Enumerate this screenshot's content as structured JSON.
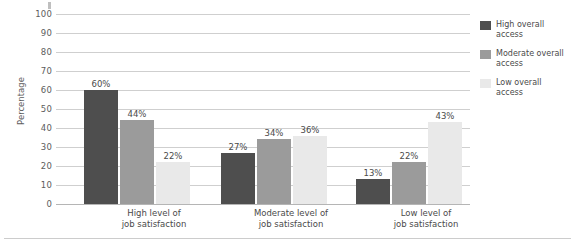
{
  "chart_data": {
    "type": "bar",
    "title": "",
    "xlabel": "",
    "ylabel": "Percentage",
    "ylim": [
      0,
      100
    ],
    "ytick_values": [
      0,
      10,
      20,
      30,
      40,
      50,
      60,
      70,
      80,
      90,
      100
    ],
    "ytick_labels": [
      "0",
      "10",
      "20",
      "30",
      "40",
      "50",
      "60",
      "70",
      "80",
      "90",
      "100"
    ],
    "grid": true,
    "legend_position": "right",
    "categories": [
      {
        "line1": "High level of",
        "line2": "job satisfaction"
      },
      {
        "line1": "Moderate level of",
        "line2": "job satisfaction"
      },
      {
        "line1": "Low level of",
        "line2": "job satisfaction"
      }
    ],
    "series": [
      {
        "name": "High overall access",
        "name_line1": "High overall",
        "name_line2": "access",
        "color": "#4e4e4e",
        "values": [
          60,
          27,
          13
        ],
        "labels": [
          "60%",
          "27%",
          "13%"
        ]
      },
      {
        "name": "Moderate overall access",
        "name_line1": "Moderate overall",
        "name_line2": "access",
        "color": "#9b9b9b",
        "values": [
          44,
          34,
          22
        ],
        "labels": [
          "44%",
          "34%",
          "22%"
        ]
      },
      {
        "name": "Low overall access",
        "name_line1": "Low overall",
        "name_line2": "access",
        "color": "#e9e9e9",
        "values": [
          22,
          36,
          43
        ],
        "labels": [
          "22%",
          "36%",
          "43%"
        ]
      }
    ]
  }
}
